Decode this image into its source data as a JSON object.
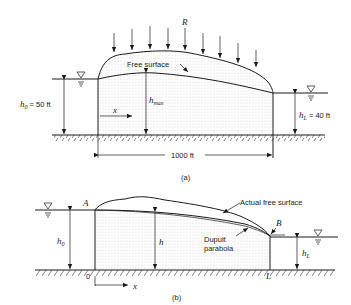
{
  "figure_a": {
    "caption": "(a)",
    "recharge_label": "R",
    "free_surface_label": "Free surface",
    "h0_symbol": "h",
    "h0_subscript": "0",
    "h0_value": " = 50 ft",
    "hL_symbol": "h",
    "hL_subscript": "L",
    "hL_value": " = 40 ft",
    "hmax_symbol": "h",
    "hmax_subscript": "max",
    "x_label": "x",
    "length_label": "1000 ft"
  },
  "figure_b": {
    "caption": "(b)",
    "point_a": "A",
    "point_b": "B",
    "origin_label": "0",
    "end_label": "L",
    "actual_surface_label": "Actual free surface",
    "dupuit_label_line1": "Dupuit",
    "dupuit_label_line2": "parabola",
    "h0_symbol": "h",
    "h0_subscript": "0",
    "h_symbol": "h",
    "hL_symbol": "h",
    "hL_subscript": "L",
    "x_label": "x"
  }
}
